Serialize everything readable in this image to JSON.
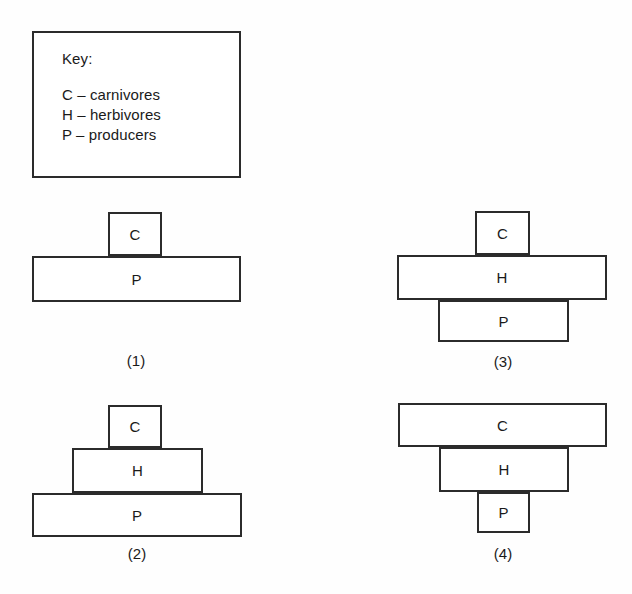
{
  "key": {
    "title": "Key:",
    "entries": [
      {
        "code": "C",
        "line": "C – carnivores"
      },
      {
        "code": "H",
        "line": "H – herbivores"
      },
      {
        "code": "P",
        "line": "P – producers"
      }
    ]
  },
  "diagram": {
    "type": "ecological-pyramid-set",
    "colors": {
      "stroke": "#2b2b2b",
      "fill": "#ffffff",
      "background": "#fefefe",
      "text": "#1a1a1a"
    },
    "pyramids": [
      {
        "caption": "(1)",
        "tiers": [
          {
            "label": "C",
            "width_rank": "narrow"
          },
          {
            "label": "P",
            "width_rank": "wide"
          }
        ]
      },
      {
        "caption": "(2)",
        "tiers": [
          {
            "label": "C",
            "width_rank": "narrow"
          },
          {
            "label": "H",
            "width_rank": "medium"
          },
          {
            "label": "P",
            "width_rank": "wide"
          }
        ]
      },
      {
        "caption": "(3)",
        "tiers": [
          {
            "label": "C",
            "width_rank": "narrow"
          },
          {
            "label": "H",
            "width_rank": "wide"
          },
          {
            "label": "P",
            "width_rank": "medium"
          }
        ]
      },
      {
        "caption": "(4)",
        "tiers": [
          {
            "label": "C",
            "width_rank": "wide"
          },
          {
            "label": "H",
            "width_rank": "medium"
          },
          {
            "label": "P",
            "width_rank": "narrow"
          }
        ]
      }
    ]
  }
}
